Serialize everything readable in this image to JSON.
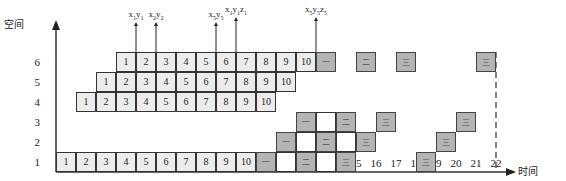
{
  "axes": {
    "y_title": "空间",
    "x_title": "时间",
    "y_ticks": [
      "1",
      "2",
      "3",
      "4",
      "5",
      "6"
    ],
    "x_ticks": [
      "1",
      "2",
      "3",
      "4",
      "5",
      "6",
      "7",
      "8",
      "9",
      "10",
      "11",
      "12",
      "13",
      "14",
      "15",
      "16",
      "17",
      "18",
      "19",
      "20",
      "21",
      "22"
    ],
    "dashed_line_at": "22"
  },
  "rows": [
    {
      "space": "1",
      "light_start_col": 1,
      "light_values": [
        "1",
        "2",
        "3",
        "4",
        "5",
        "6",
        "7",
        "8",
        "9",
        "10"
      ],
      "gray": [
        {
          "col": 11,
          "label": "一"
        },
        {
          "col": 13,
          "label": "二"
        },
        {
          "col": 15,
          "label": "三"
        },
        {
          "col": 19,
          "label": "三"
        }
      ],
      "blank": [
        12,
        14
      ]
    },
    {
      "space": "2",
      "light_start_col": null,
      "light_values": [],
      "gray": [
        {
          "col": 12,
          "label": "一"
        },
        {
          "col": 14,
          "label": "二"
        },
        {
          "col": 16,
          "label": "三"
        },
        {
          "col": 20,
          "label": "三"
        }
      ],
      "blank": [
        13,
        15
      ]
    },
    {
      "space": "3",
      "light_start_col": null,
      "light_values": [],
      "gray": [
        {
          "col": 13,
          "label": "一"
        },
        {
          "col": 15,
          "label": "二"
        },
        {
          "col": 17,
          "label": "三"
        },
        {
          "col": 21,
          "label": "三"
        }
      ],
      "blank": [
        14
      ]
    },
    {
      "space": "4",
      "light_start_col": 2,
      "light_values": [
        "1",
        "2",
        "3",
        "4",
        "5",
        "6",
        "7",
        "8",
        "9",
        "10"
      ],
      "gray": [],
      "blank": []
    },
    {
      "space": "5",
      "light_start_col": 3,
      "light_values": [
        "1",
        "2",
        "3",
        "4",
        "5",
        "6",
        "7",
        "8",
        "9",
        "10"
      ],
      "gray": [],
      "blank": []
    },
    {
      "space": "6",
      "light_start_col": 4,
      "light_values": [
        "1",
        "2",
        "3",
        "4",
        "5",
        "6",
        "7",
        "8",
        "9",
        "10"
      ],
      "gray": [
        {
          "col": 14,
          "label": "一"
        },
        {
          "col": 16,
          "label": "二"
        },
        {
          "col": 18,
          "label": "三"
        },
        {
          "col": 22,
          "label": "三"
        }
      ],
      "blank": []
    }
  ],
  "annotations": [
    {
      "text": "x1y1",
      "base": "x",
      "s1": "1",
      "mid": "y",
      "s2": "1",
      "tail": "",
      "s3": "",
      "at_tick": 4
    },
    {
      "text": "x2y2",
      "base": "x",
      "s1": "2",
      "mid": "y",
      "s2": "2",
      "tail": "",
      "s3": "",
      "at_tick": 5
    },
    {
      "text": "x5y5",
      "base": "x",
      "s1": "5",
      "mid": "y",
      "s2": "5",
      "tail": "",
      "s3": "",
      "at_tick": 8
    },
    {
      "text": "x1y1z1",
      "base": "x",
      "s1": "1",
      "mid": "y",
      "s2": "1",
      "tail": "z",
      "s3": "1",
      "at_tick": 9
    },
    {
      "text": "x5y5z5",
      "base": "x",
      "s1": "5",
      "mid": "y",
      "s2": "5",
      "tail": "z",
      "s3": "5",
      "at_tick": 13
    }
  ],
  "colors": {
    "light_cell": "#ececec",
    "gray_cell": "#b4b4b4",
    "axis": "#333333"
  }
}
